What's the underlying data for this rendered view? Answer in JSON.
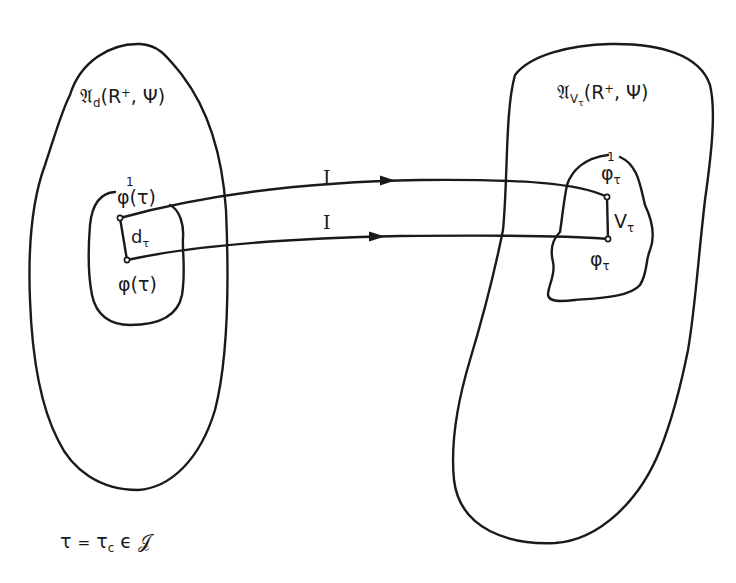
{
  "diagram": {
    "type": "mapping-between-sets",
    "colors": {
      "stroke": "#1a1a1a",
      "background": "#ffffff"
    },
    "left_set": {
      "label_main": "𝔄",
      "label_sub": "d",
      "label_args_open": "(R",
      "label_sup": "+",
      "label_args_close": ", Ψ)",
      "inner_region": {
        "top_point": {
          "overmark": "1",
          "label": "φ(τ)"
        },
        "segment_label_main": "d",
        "segment_label_sub": "τ",
        "bottom_point": {
          "label": "φ(τ)"
        }
      }
    },
    "right_set": {
      "label_main": "𝔄",
      "label_sub": "V",
      "label_subsub": "τ",
      "label_args_open": "(R",
      "label_sup": "+",
      "label_args_close": ", Ψ)",
      "inner_region": {
        "top_point": {
          "overmark": "1",
          "label_main": "φ",
          "label_sub": "τ"
        },
        "segment_label_main": "V",
        "segment_label_sub": "τ",
        "bottom_point": {
          "label_main": "φ",
          "label_sub": "τ"
        }
      }
    },
    "arrows": [
      {
        "label": "I",
        "from": "left.top_point",
        "to": "right.top_point"
      },
      {
        "label": "I",
        "from": "left.bottom_point",
        "to": "right.bottom_point"
      }
    ],
    "caption": {
      "lhs": "τ",
      "eq": "=",
      "rhs_main": "τ",
      "rhs_sub": "c",
      "member": "ϵ",
      "set": "𝒥"
    }
  }
}
